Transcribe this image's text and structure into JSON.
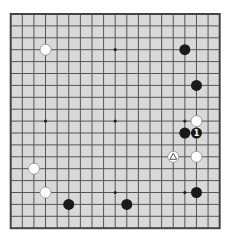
{
  "board": {
    "size": 19,
    "origin_x": 10.7,
    "origin_y": 14,
    "spacing_x": 11.61,
    "spacing_y": 11.9,
    "colors": {
      "page_bg": "#ffffff",
      "board_fill": "#d9d9d9",
      "grid_line": "#555555",
      "border": "#444444",
      "black_stone": "#1a1a1a",
      "white_stone": "#ffffff",
      "white_stone_edge": "#8a8a8a"
    },
    "star_points": [
      {
        "col": 3,
        "row": 3
      },
      {
        "col": 9,
        "row": 3
      },
      {
        "col": 15,
        "row": 3
      },
      {
        "col": 3,
        "row": 9
      },
      {
        "col": 9,
        "row": 9
      },
      {
        "col": 15,
        "row": 9
      },
      {
        "col": 3,
        "row": 15
      },
      {
        "col": 9,
        "row": 15
      },
      {
        "col": 15,
        "row": 15
      }
    ],
    "stones": [
      {
        "color": "white",
        "col": 3,
        "row": 3
      },
      {
        "color": "black",
        "col": 15,
        "row": 3
      },
      {
        "color": "black",
        "col": 16,
        "row": 6
      },
      {
        "color": "white",
        "col": 16,
        "row": 9
      },
      {
        "color": "black",
        "col": 15,
        "row": 10
      },
      {
        "color": "black",
        "col": 16,
        "row": 10,
        "label": "1"
      },
      {
        "color": "white",
        "col": 14,
        "row": 12,
        "marker": "triangle"
      },
      {
        "color": "white",
        "col": 16,
        "row": 12
      },
      {
        "color": "white",
        "col": 2,
        "row": 13
      },
      {
        "color": "white",
        "col": 3,
        "row": 15
      },
      {
        "color": "black",
        "col": 16,
        "row": 15
      },
      {
        "color": "black",
        "col": 5,
        "row": 16
      },
      {
        "color": "black",
        "col": 10,
        "row": 16
      }
    ]
  }
}
